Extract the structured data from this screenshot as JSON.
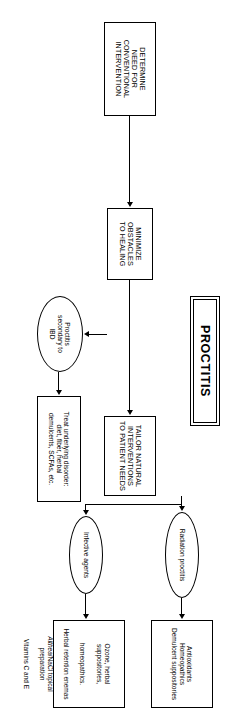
{
  "figure": {
    "title": "PROCTITIS",
    "orientation": "landscape-rotated-90"
  },
  "stages": {
    "determine": "DETERMINE\nNEED FOR\nCONVENTIONAL\nINTERVENTION",
    "minimize": "MINIMIZE\nOBSTACLES\nTO HEALING",
    "tailor": "TAILOR NATURAL\nINTERVENTIONS\nTO PATIENT NEEDS"
  },
  "conditions": {
    "ibd": "Proctitis\nsecondary to\nIBD",
    "radiation": "Radiation proctitis",
    "infective": "Infective agents"
  },
  "treatments": {
    "ibd_treatment": "Treat underlying disorder:\ndiet, fiber, herbal\ndemulcents, SCFAs, etc.",
    "radiation_treatment": "Antioxidants\nHomeopathics\nDemulcent suppositories",
    "infective_treatment_lines": [
      {
        "text": "Ozone, herbal suppositories,",
        "italic_part": ""
      },
      {
        "text": "homeopathics.",
        "italic_part": ""
      },
      {
        "text": "Herbal retention enemas",
        "italic_part": ""
      },
      {
        "text": "Althea",
        "italic_part": "Althea"
      },
      {
        "text": "/NaCl topical preparation",
        "italic_part": ""
      },
      {
        "text": "Vitamins C and E",
        "italic_part": ""
      }
    ],
    "infective_treatment_l1": "Ozone, herbal suppositories,",
    "infective_treatment_l2": "homeopathics.",
    "infective_treatment_l3": "Herbal retention enemas",
    "infective_treatment_l4a": "Althea",
    "infective_treatment_l4b": "/NaCl topical preparation",
    "infective_treatment_l5": "Vitamins C and E"
  },
  "colors": {
    "stroke": "#000000",
    "background": "#ffffff",
    "text": "#000000"
  }
}
